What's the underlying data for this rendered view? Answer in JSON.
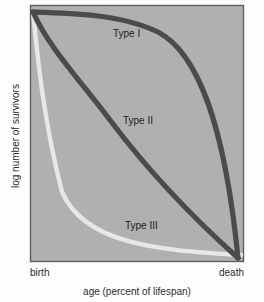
{
  "chart_data": {
    "type": "line",
    "title": "",
    "xlabel": "age (percent of lifespan)",
    "ylabel": "log number of survivors",
    "xlim": [
      0,
      100
    ],
    "ylim": [
      0,
      100
    ],
    "grid": false,
    "legend_position": "inline-annotations",
    "xtick_labels": [
      "birth",
      "death"
    ],
    "xticks": [
      0,
      100
    ],
    "ytick_labels": [],
    "plot_background": "#b0b0b0",
    "x": [
      0,
      10,
      20,
      30,
      40,
      50,
      60,
      70,
      80,
      90,
      95,
      100
    ],
    "series": [
      {
        "name": "Type I",
        "color": "#4b4b4b",
        "label": "Type I",
        "values": [
          100,
          99.5,
          99,
          98,
          96.5,
          94,
          89,
          81,
          68,
          45,
          26,
          0
        ]
      },
      {
        "name": "Type II",
        "color": "#4b4b4b",
        "label": "Type II",
        "values": [
          100,
          78,
          66,
          58,
          52,
          46,
          40,
          33,
          25,
          16,
          9,
          0
        ]
      },
      {
        "name": "Type III",
        "color": "#e9e7e1",
        "label": "Type III",
        "values": [
          100,
          46,
          28,
          19,
          14,
          10.5,
          8,
          6,
          4.5,
          3.2,
          2.6,
          2
        ]
      }
    ],
    "annotations": [
      {
        "text": "Type I",
        "x": 113,
        "y": 37
      },
      {
        "text": "Type II",
        "x": 123,
        "y": 124
      },
      {
        "text": "Type III",
        "x": 125,
        "y": 229
      }
    ]
  },
  "axes": {
    "y_axis_title": "log number of survivors",
    "x_axis_title": "age (percent of lifespan)",
    "x_start_label": "birth",
    "x_end_label": "death"
  },
  "curves": {
    "type_i_label": "Type I",
    "type_ii_label": "Type II",
    "type_iii_label": "Type III"
  },
  "geometry": {
    "type_i_path": "M 33 12 C 70 13, 120 14, 158 32 C 196 52, 224 118, 238 258",
    "type_ii_path": "M 33 12 C 48 46, 78 78, 110 120 C 140 160, 180 206, 238 258",
    "type_iii_path": "M 33 12 C 38 62, 44 122, 62 192 C 84 242, 150 250, 241 255"
  }
}
